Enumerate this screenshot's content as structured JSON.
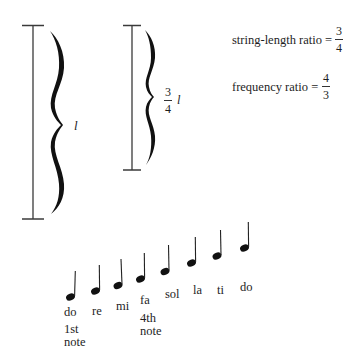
{
  "diagram": {
    "left_string": {
      "label": "l",
      "top_y": 25,
      "bottom_y": 219
    },
    "right_string": {
      "label_numerator": "3",
      "label_denominator": "4",
      "label_suffix": "l",
      "top_y": 25,
      "bottom_y": 170
    },
    "ratios": {
      "string_length": {
        "label": "string-length ratio =",
        "numerator": "3",
        "denominator": "4"
      },
      "frequency": {
        "label": "frequency ratio =",
        "numerator": "4",
        "denominator": "3"
      }
    },
    "scale": {
      "notes": [
        {
          "name": "do",
          "step": 1
        },
        {
          "name": "re",
          "step": 2
        },
        {
          "name": "mi",
          "step": 3
        },
        {
          "name": "fa",
          "step": 4
        },
        {
          "name": "sol",
          "step": 5
        },
        {
          "name": "la",
          "step": 6
        },
        {
          "name": "ti",
          "step": 7
        },
        {
          "name": "do",
          "step": 8
        }
      ],
      "annotations": {
        "first_line1": "1st",
        "first_line2": "note",
        "fourth_line1": "4th",
        "fourth_line2": "note"
      }
    },
    "colors": {
      "ink": "#1a1a1a",
      "line": "#333333",
      "background": "#ffffff"
    }
  }
}
